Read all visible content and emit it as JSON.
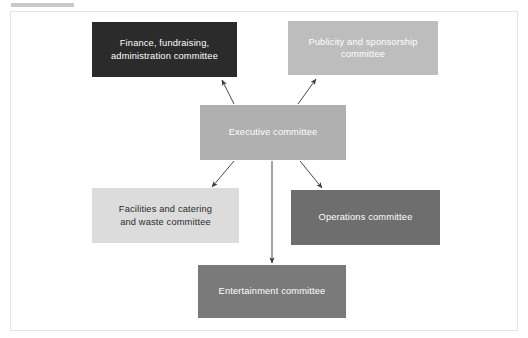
{
  "figure": {
    "type": "organisational-chart",
    "background_color": "#ffffff",
    "frame_border_color": "#e4e4e4",
    "header_rule_color": "#c9c9c9"
  },
  "nodes": {
    "finance": {
      "label": "Finance, fundraising,\nadministration committee",
      "fill": "#2b2b2b",
      "text_color": "#ffffff"
    },
    "publicity": {
      "label": "Publicity and sponsorship\ncommittee",
      "fill": "#bdbdbd",
      "text_color": "#ffffff"
    },
    "executive": {
      "label": "Executive committee",
      "fill": "#b0b0b0",
      "text_color": "#ffffff"
    },
    "facilities": {
      "label": "Facilities and catering\nand waste committee",
      "fill": "#dcdcdc",
      "text_color": "#2b2b2b"
    },
    "operations": {
      "label": "Operations committee",
      "fill": "#6e6e6e",
      "text_color": "#ffffff"
    },
    "entertainment": {
      "label": "Entertainment committee",
      "fill": "#7a7a7a",
      "text_color": "#ffffff"
    }
  },
  "connectors": {
    "line_color": "#4a4a4a",
    "edges": [
      {
        "name": "executive-to-finance",
        "from": "executive",
        "to": "finance",
        "direction": "up-left"
      },
      {
        "name": "executive-to-publicity",
        "from": "executive",
        "to": "publicity",
        "direction": "up-right"
      },
      {
        "name": "executive-to-facilities",
        "from": "executive",
        "to": "facilities",
        "direction": "down-left"
      },
      {
        "name": "executive-to-operations",
        "from": "executive",
        "to": "operations",
        "direction": "down-right"
      },
      {
        "name": "executive-to-entertainment",
        "from": "executive",
        "to": "entertainment",
        "direction": "down"
      }
    ]
  }
}
